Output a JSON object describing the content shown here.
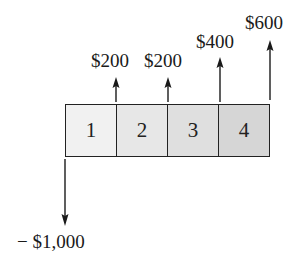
{
  "diagram": {
    "periods": [
      {
        "label": "1",
        "shade": "#f1f1f1"
      },
      {
        "label": "2",
        "shade": "#e6e6e6"
      },
      {
        "label": "3",
        "shade": "#dedede"
      },
      {
        "label": "4",
        "shade": "#d4d4d4"
      }
    ],
    "inflows": [
      {
        "period": "1",
        "amount": "$200"
      },
      {
        "period": "2",
        "amount": "$200"
      },
      {
        "period": "3",
        "amount": "$400"
      },
      {
        "period": "4",
        "amount": "$600"
      }
    ],
    "outflow": {
      "period": "0",
      "amount": "− $1,000"
    },
    "colors": {
      "line": "#1a1a1a",
      "border": "#222222"
    }
  }
}
